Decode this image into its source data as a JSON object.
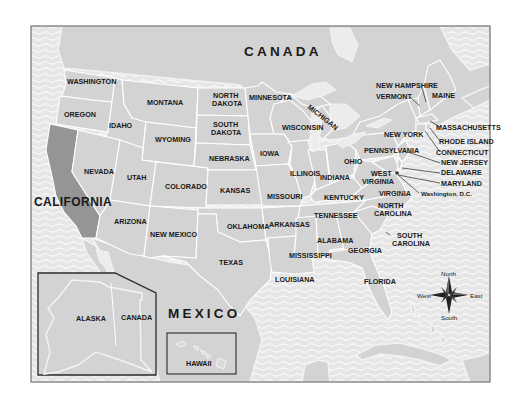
{
  "map": {
    "title": "United States of America political map",
    "highlighted_state": "CALIFORNIA",
    "colors": {
      "land": "#d3d3d3",
      "highlight": "#959595",
      "water": "#e6e6e6",
      "water_wave": "#f6f6f6",
      "border": "#ffffff",
      "frame": "#555555",
      "text": "#1a1a1a"
    },
    "countries": {
      "canada": "CANADA",
      "mexico": "MEXICO"
    },
    "states": {
      "washington": "WASHINGTON",
      "oregon": "OREGON",
      "california": "CALIFORNIA",
      "idaho": "IDAHO",
      "nevada": "NEVADA",
      "montana": "MONTANA",
      "wyoming": "WYOMING",
      "utah": "UTAH",
      "arizona": "ARIZONA",
      "colorado": "COLORADO",
      "new_mexico": "NEW MEXICO",
      "north_dakota_1": "NORTH",
      "north_dakota_2": "DAKOTA",
      "south_dakota_1": "SOUTH",
      "south_dakota_2": "DAKOTA",
      "nebraska": "NEBRASKA",
      "kansas": "KANSAS",
      "oklahoma": "OKLAHOMA",
      "texas": "TEXAS",
      "minnesota": "MINNESOTA",
      "iowa": "IOWA",
      "missouri": "MISSOURI",
      "arkansas": "ARKANSAS",
      "louisiana": "LOUISIANA",
      "wisconsin": "WISCONSIN",
      "michigan": "MICHIGAN",
      "illinois": "ILLINOIS",
      "indiana": "INDIANA",
      "ohio": "OHIO",
      "kentucky": "KENTUCKY",
      "tennessee": "TENNESSEE",
      "mississippi": "MISSISSIPPI",
      "alabama": "ALABAMA",
      "georgia": "GEORGIA",
      "florida": "FLORIDA",
      "south_carolina_1": "SOUTH",
      "south_carolina_2": "CAROLINA",
      "north_carolina_1": "NORTH",
      "north_carolina_2": "CAROLINA",
      "virginia": "VIRGINIA",
      "west_virginia_1": "WEST",
      "west_virginia_2": "VIRGINIA",
      "pennsylvania": "PENNSYLVANIA",
      "new_york": "NEW YORK",
      "vermont": "VERMONT",
      "new_hampshire": "NEW HAMPSHIRE",
      "maine": "MAINE",
      "massachusetts": "MASSACHUSETTS",
      "rhode_island": "RHODE ISLAND",
      "connecticut": "CONNECTICUT",
      "new_jersey": "NEW JERSEY",
      "delaware": "DELAWARE",
      "maryland": "MARYLAND",
      "dc": "Washington, D.C."
    },
    "insets": {
      "alaska": {
        "label": "ALASKA",
        "neighbor": "CANADA"
      },
      "hawaii": {
        "label": "HAWAII"
      }
    },
    "compass": {
      "north": "North",
      "south": "South",
      "east": "East",
      "west": "West"
    }
  }
}
